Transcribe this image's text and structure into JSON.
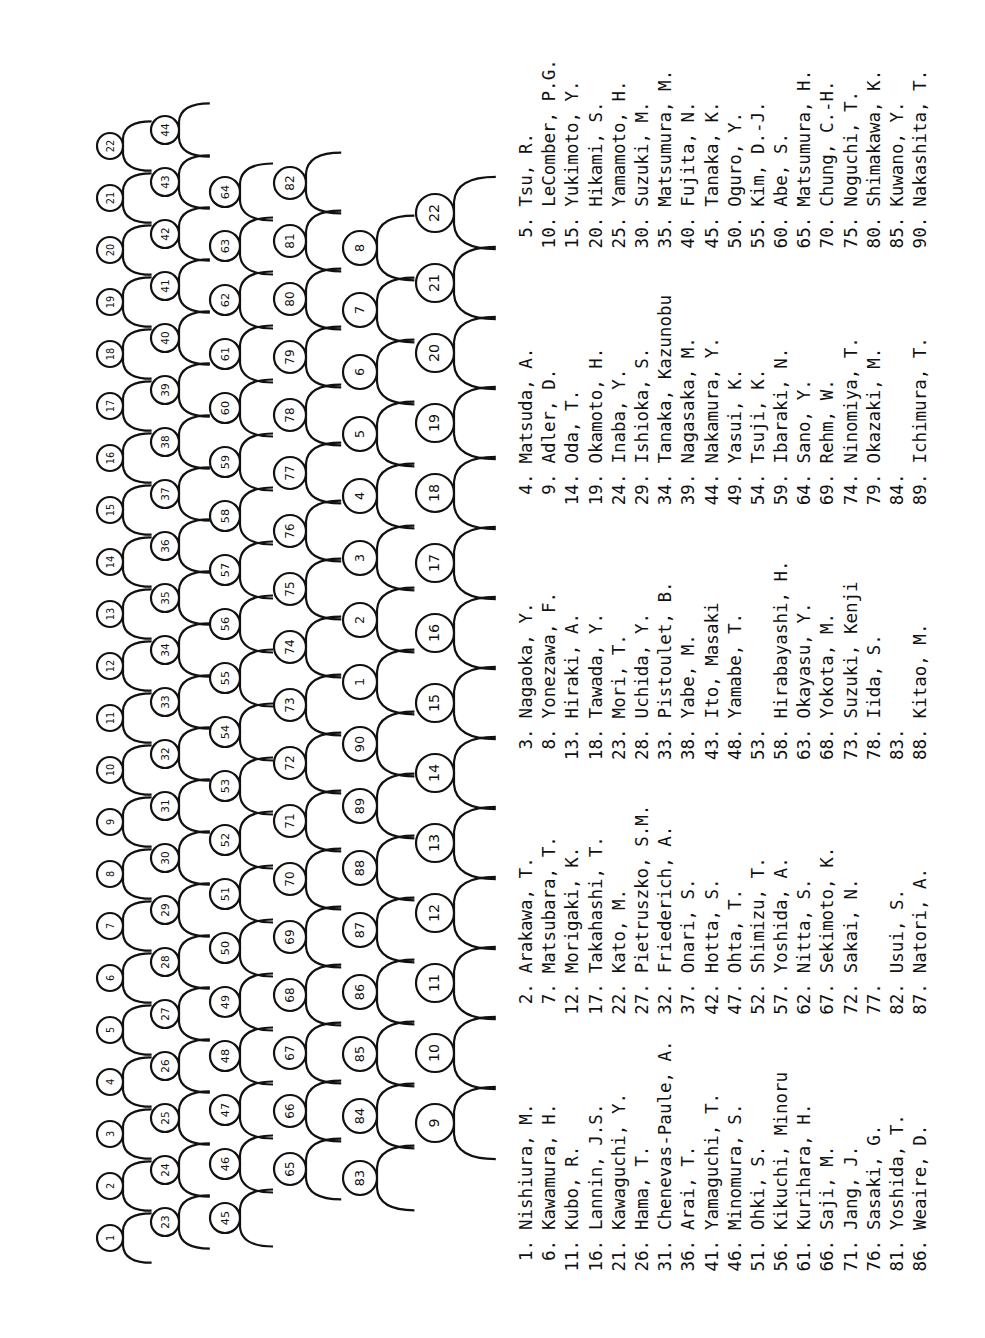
{
  "document": {
    "orientation": "rotated-90",
    "diagram": {
      "description": "Hand-drawn silhouette key of group photograph with numbered heads",
      "figure_labels_visible": [
        "1",
        "2",
        "3",
        "4",
        "5",
        "6",
        "7",
        "8",
        "9",
        "10",
        "11",
        "12",
        "13",
        "14",
        "15",
        "16",
        "17",
        "18",
        "19",
        "20",
        "21",
        "22",
        "23",
        "24",
        "25",
        "26",
        "27",
        "28",
        "29",
        "30",
        "31",
        "32",
        "33",
        "34",
        "35",
        "36",
        "37",
        "38",
        "39",
        "40",
        "41",
        "42",
        "43",
        "44",
        "45",
        "46",
        "47",
        "48",
        "49",
        "50",
        "51",
        "52",
        "53",
        "54",
        "55",
        "56",
        "57",
        "58",
        "59",
        "60",
        "61",
        "62",
        "63",
        "64",
        "65",
        "66",
        "67",
        "68",
        "69",
        "70",
        "71",
        "72",
        "73",
        "74",
        "75",
        "76",
        "77",
        "78",
        "79",
        "80",
        "81",
        "82",
        "83",
        "84",
        "85",
        "86",
        "87",
        "88",
        "89",
        "90"
      ]
    },
    "columns": [
      {
        "entries": [
          {
            "num": "1.",
            "name": "Nishiura, M."
          },
          {
            "num": "6.",
            "name": "Kawamura, H."
          },
          {
            "num": "11.",
            "name": "Kubo, R."
          },
          {
            "num": "16.",
            "name": "Lannin, J.S."
          },
          {
            "num": "21.",
            "name": "Kawaguchi, Y."
          },
          {
            "num": "26.",
            "name": "Hama, T."
          },
          {
            "num": "31.",
            "name": "Chenevas-Paule, A."
          },
          {
            "num": "36.",
            "name": "Arai, T."
          },
          {
            "num": "41.",
            "name": "Yamaguchi, T."
          },
          {
            "num": "46.",
            "name": "Minomura, S."
          },
          {
            "num": "51.",
            "name": "Ohki, S."
          },
          {
            "num": "56.",
            "name": "Kikuchi, Minoru"
          },
          {
            "num": "61.",
            "name": "Kurihara, H."
          },
          {
            "num": "66.",
            "name": "Saji, M."
          },
          {
            "num": "71.",
            "name": "Jang, J."
          },
          {
            "num": "76.",
            "name": "Sasaki, G."
          },
          {
            "num": "81.",
            "name": "Yoshida, T."
          },
          {
            "num": "86.",
            "name": "Weaire, D."
          }
        ]
      },
      {
        "entries": [
          {
            "num": "2.",
            "name": "Arakawa, T."
          },
          {
            "num": "7.",
            "name": "Matsubara, T."
          },
          {
            "num": "12.",
            "name": "Morigaki, K."
          },
          {
            "num": "17.",
            "name": "Takahashi, T."
          },
          {
            "num": "22.",
            "name": "Kato, M."
          },
          {
            "num": "27.",
            "name": "Pietruszko, S.M."
          },
          {
            "num": "32.",
            "name": "Friederich, A."
          },
          {
            "num": "37.",
            "name": "Onari, S."
          },
          {
            "num": "42.",
            "name": "Hotta, S."
          },
          {
            "num": "47.",
            "name": "Ohta, T."
          },
          {
            "num": "52.",
            "name": "Shimizu, T."
          },
          {
            "num": "57.",
            "name": "Yoshida, A."
          },
          {
            "num": "62.",
            "name": "Nitta, S."
          },
          {
            "num": "67.",
            "name": "Sekimoto, K."
          },
          {
            "num": "72.",
            "name": "Sakai, N."
          },
          {
            "num": "77.",
            "name": ""
          },
          {
            "num": "82.",
            "name": "Usui, S."
          },
          {
            "num": "87.",
            "name": "Natori, A."
          }
        ]
      },
      {
        "entries": [
          {
            "num": "3.",
            "name": "Nagaoka, Y."
          },
          {
            "num": "8.",
            "name": "Yonezawa, F."
          },
          {
            "num": "13.",
            "name": "Hiraki, A."
          },
          {
            "num": "18.",
            "name": "Tawada, Y."
          },
          {
            "num": "23.",
            "name": "Mori, T."
          },
          {
            "num": "28.",
            "name": "Uchida, Y."
          },
          {
            "num": "33.",
            "name": "Pistoulet, B."
          },
          {
            "num": "38.",
            "name": "Yabe, M."
          },
          {
            "num": "43.",
            "name": "Ito, Masaki"
          },
          {
            "num": "48.",
            "name": "Yamabe, T."
          },
          {
            "num": "53.",
            "name": ""
          },
          {
            "num": "58.",
            "name": "Hirabayashi, H."
          },
          {
            "num": "63.",
            "name": "Okayasu, Y."
          },
          {
            "num": "68.",
            "name": "Yokota, M."
          },
          {
            "num": "73.",
            "name": "Suzuki, Kenji"
          },
          {
            "num": "78.",
            "name": "Iida, S."
          },
          {
            "num": "83.",
            "name": ""
          },
          {
            "num": "88.",
            "name": "Kitao, M."
          }
        ]
      },
      {
        "entries": [
          {
            "num": "4.",
            "name": "Matsuda, A."
          },
          {
            "num": "9.",
            "name": "Adler, D."
          },
          {
            "num": "14.",
            "name": "Oda, T."
          },
          {
            "num": "19.",
            "name": "Okamoto, H."
          },
          {
            "num": "24.",
            "name": "Inaba, Y."
          },
          {
            "num": "29.",
            "name": "Ishioka, S."
          },
          {
            "num": "34.",
            "name": "Tanaka, Kazunobu"
          },
          {
            "num": "39.",
            "name": "Nagasaka, M."
          },
          {
            "num": "44.",
            "name": "Nakamura, Y."
          },
          {
            "num": "49.",
            "name": "Yasui, K."
          },
          {
            "num": "54.",
            "name": "Tsuji, K."
          },
          {
            "num": "59.",
            "name": "Ibaraki, N."
          },
          {
            "num": "64.",
            "name": "Sano, Y."
          },
          {
            "num": "69.",
            "name": "Rehm, W."
          },
          {
            "num": "74.",
            "name": "Ninomiya, T."
          },
          {
            "num": "79.",
            "name": "Okazaki, M."
          },
          {
            "num": "84.",
            "name": ""
          },
          {
            "num": "89.",
            "name": "Ichimura, T."
          }
        ]
      },
      {
        "entries": [
          {
            "num": "5.",
            "name": "Tsu, R."
          },
          {
            "num": "10.",
            "name": "LeComber, P.G."
          },
          {
            "num": "15.",
            "name": "Yukimoto, Y."
          },
          {
            "num": "20.",
            "name": "Hikami, S."
          },
          {
            "num": "25.",
            "name": "Yamamoto, H."
          },
          {
            "num": "30.",
            "name": "Suzuki, M."
          },
          {
            "num": "35.",
            "name": "Matsumura, M."
          },
          {
            "num": "40.",
            "name": "Fujita, N."
          },
          {
            "num": "45.",
            "name": "Tanaka, K."
          },
          {
            "num": "50.",
            "name": "Oguro, Y."
          },
          {
            "num": "55.",
            "name": "Kim, D.-J."
          },
          {
            "num": "60.",
            "name": "Abe, S."
          },
          {
            "num": "65.",
            "name": "Matsumura, H."
          },
          {
            "num": "70.",
            "name": "Chung, C.-H."
          },
          {
            "num": "75.",
            "name": "Noguchi, T."
          },
          {
            "num": "80.",
            "name": "Shimakawa, K."
          },
          {
            "num": "85.",
            "name": "Kuwano, Y."
          },
          {
            "num": "90.",
            "name": "Nakashita, T."
          }
        ]
      }
    ]
  }
}
